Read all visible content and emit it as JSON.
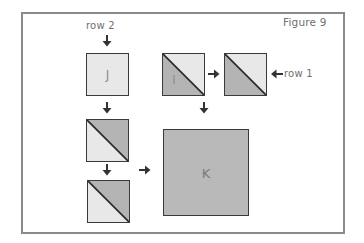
{
  "figure": {
    "title": "Figure 9",
    "row_labels": {
      "row1": "row 1",
      "row2": "row 2"
    },
    "colors": {
      "frame": "#8a8a8a",
      "light_fabric": "#e8e8e8",
      "dark_fabric": "#b4b4b4",
      "outline": "#3a3a3a",
      "label_text": "#707070"
    },
    "blocks": [
      {
        "id": "J",
        "label": "J",
        "type": "solid-light"
      },
      {
        "id": "hst-row2-a",
        "label": "",
        "type": "half-square-triangle",
        "dark": "upper-right"
      },
      {
        "id": "hst-row2-b",
        "label": "",
        "type": "half-square-triangle",
        "dark": "upper-right"
      },
      {
        "id": "I",
        "label": "I",
        "type": "half-square-triangle",
        "dark": "lower-left"
      },
      {
        "id": "hst-row1-b",
        "label": "",
        "type": "half-square-triangle",
        "dark": "lower-left"
      },
      {
        "id": "K",
        "label": "K",
        "type": "solid-dark"
      }
    ]
  }
}
